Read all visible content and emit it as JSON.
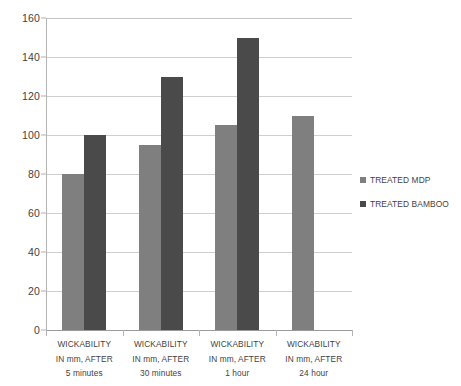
{
  "chart_data": {
    "type": "bar",
    "title": "",
    "subtitle": "",
    "xlabel": "",
    "ylabel": "",
    "ylim": [
      0,
      160
    ],
    "ytick_step": 20,
    "yticks": [
      0,
      20,
      40,
      60,
      80,
      100,
      120,
      140,
      160
    ],
    "grid": true,
    "legend_position": "right",
    "categories": [
      "WICKABILITY IN mm, AFTER 5 minutes",
      "WICKABILITY IN mm, AFTER 30 minutes",
      "WICKABILITY IN mm, AFTER 1 hour",
      "WICKABILITY IN mm, AFTER 24 hour"
    ],
    "category_lines": [
      [
        "WICKABILITY",
        "IN mm, AFTER",
        "5 minutes"
      ],
      [
        "WICKABILITY",
        "IN mm, AFTER",
        "30 minutes"
      ],
      [
        "WICKABILITY",
        "IN mm, AFTER",
        "1 hour"
      ],
      [
        "WICKABILITY",
        "IN mm, AFTER",
        "24 hour"
      ]
    ],
    "series": [
      {
        "name": "TREATED MDP",
        "color": "#7f7f7f",
        "values": [
          80,
          95,
          105,
          110
        ]
      },
      {
        "name": "TREATED BAMBOO",
        "color": "#4a4a4a",
        "values": [
          100,
          130,
          150,
          null
        ]
      }
    ]
  },
  "colors": {
    "background": "#ffffff",
    "gridline": "#cfcfcf",
    "axis": "#b5b5b5",
    "text": "#3f3f3f",
    "series_mdp": "#7f7f7f",
    "series_bamboo": "#4a4a4a"
  }
}
